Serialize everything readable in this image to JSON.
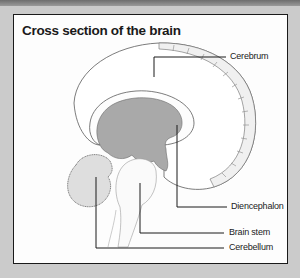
{
  "title": "Cross section of the brain",
  "labels": {
    "cerebrum": "Cerebrum",
    "diencephalon": "Diencephalon",
    "brain_stem": "Brain stem",
    "cerebellum": "Cerebellum"
  },
  "colors": {
    "background": "#cbcbcb",
    "panel": "#fdfdfd",
    "border": "#1a1a1a",
    "diencephalon_fill": "#a9a9a9",
    "cerebellum_fill": "#dedede",
    "outline": "#555555"
  }
}
